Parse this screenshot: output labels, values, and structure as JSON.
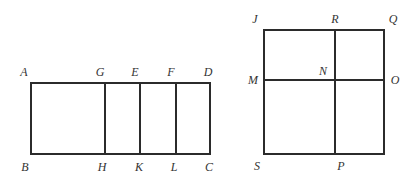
{
  "figure_left": {
    "name": "rectangle ABCD",
    "rect": {
      "x1": 31,
      "y1": 83,
      "x2": 210,
      "y2": 154
    },
    "dividers_x": [
      105,
      140,
      176
    ],
    "labels": [
      {
        "text": "A",
        "x": 24,
        "y": 72
      },
      {
        "text": "G",
        "x": 100,
        "y": 72
      },
      {
        "text": "E",
        "x": 135,
        "y": 72
      },
      {
        "text": "F",
        "x": 171,
        "y": 72
      },
      {
        "text": "D",
        "x": 208,
        "y": 72
      },
      {
        "text": "B",
        "x": 25,
        "y": 167
      },
      {
        "text": "H",
        "x": 102,
        "y": 167
      },
      {
        "text": "K",
        "x": 139,
        "y": 167
      },
      {
        "text": "L",
        "x": 174,
        "y": 167
      },
      {
        "text": "C",
        "x": 209,
        "y": 167
      }
    ]
  },
  "figure_right": {
    "name": "square JQPS",
    "rect": {
      "x1": 264,
      "y1": 30,
      "x2": 384,
      "y2": 154
    },
    "divider_x": 335,
    "divider_y": 80,
    "labels": [
      {
        "text": "J",
        "x": 255,
        "y": 19
      },
      {
        "text": "R",
        "x": 335,
        "y": 19
      },
      {
        "text": "Q",
        "x": 393,
        "y": 19
      },
      {
        "text": "M",
        "x": 253,
        "y": 80
      },
      {
        "text": "N",
        "x": 323,
        "y": 71
      },
      {
        "text": "O",
        "x": 395,
        "y": 80
      },
      {
        "text": "S",
        "x": 257,
        "y": 166
      },
      {
        "text": "P",
        "x": 341,
        "y": 166
      }
    ]
  },
  "style": {
    "stroke": "#2b2b2b",
    "stroke_width": 2
  }
}
